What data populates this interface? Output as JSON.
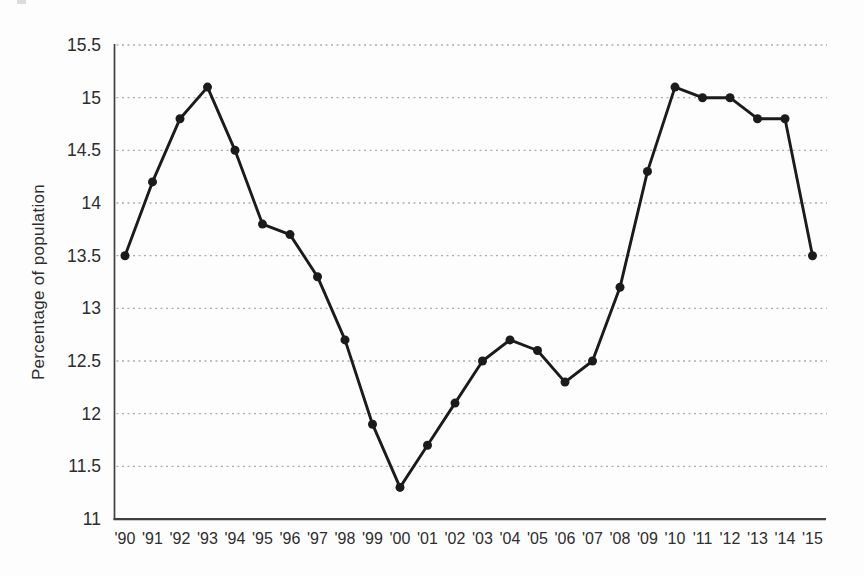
{
  "figure": {
    "background": "#fdfdfd"
  },
  "chart_data": {
    "type": "line",
    "title": "",
    "xlabel": "",
    "ylabel": "Percentage of population",
    "x": [
      "'90",
      "'91",
      "'92",
      "'93",
      "'94",
      "'95",
      "'96",
      "'97",
      "'98",
      "'99",
      "'00",
      "'01",
      "'02",
      "'03",
      "'04",
      "'05",
      "'06",
      "'07",
      "'08",
      "'09",
      "'10",
      "'11",
      "'12",
      "'13",
      "'14",
      "'15"
    ],
    "series": [
      {
        "name": "Percentage of population",
        "values": [
          13.5,
          14.2,
          14.8,
          15.1,
          14.5,
          13.8,
          13.7,
          13.3,
          12.7,
          11.9,
          11.3,
          11.7,
          12.1,
          12.5,
          12.7,
          12.6,
          12.3,
          12.5,
          13.2,
          14.3,
          15.1,
          15.0,
          15.0,
          14.8,
          14.8,
          13.5
        ]
      }
    ],
    "ylim": [
      11,
      15.5
    ],
    "ytick_step": 0.5,
    "ytick_labels": [
      "11",
      "11.5",
      "12",
      "12.5",
      "13",
      "13.5",
      "14",
      "14.5",
      "15",
      "15.5"
    ],
    "grid": "horizontal dashed",
    "legend_position": "none",
    "marker": "filled-circle",
    "colors": {
      "line": "#1b1b1b",
      "marker": "#1b1b1b",
      "grid": "#adadad",
      "axis": "#3f3f3f",
      "text": "#2d2d2d",
      "background": "#fdfdfd"
    }
  }
}
